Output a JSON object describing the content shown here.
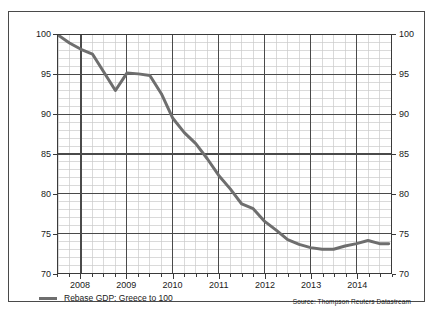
{
  "chart_data": {
    "type": "line",
    "title": "",
    "subtitle": "",
    "xlabel": "",
    "ylabel": "",
    "xlim": [
      2007.5,
      2014.75
    ],
    "ylim": [
      70,
      100
    ],
    "y_ticks": [
      70,
      75,
      80,
      85,
      90,
      95,
      100
    ],
    "y_tick_labels": [
      "70",
      "75",
      "80",
      "85",
      "90",
      "95",
      "100"
    ],
    "y_minor_step": 1,
    "x_ticks": [
      2008,
      2009,
      2010,
      2011,
      2012,
      2013,
      2014
    ],
    "x_tick_labels": [
      "2008",
      "2009",
      "2010",
      "2011",
      "2012",
      "2013",
      "2014"
    ],
    "x_minor_step": 0.25,
    "grid": true,
    "dual_y_axis": true,
    "legend_position": "bottom-left",
    "series": [
      {
        "name": "Rebase GDP: Greece to 100",
        "color": "#6e6e6e",
        "x": [
          2007.5,
          2007.75,
          2008.0,
          2008.25,
          2008.5,
          2008.75,
          2009.0,
          2009.25,
          2009.5,
          2009.75,
          2010.0,
          2010.25,
          2010.5,
          2010.75,
          2011.0,
          2011.25,
          2011.5,
          2011.75,
          2012.0,
          2012.25,
          2012.5,
          2012.75,
          2013.0,
          2013.25,
          2013.5,
          2013.75,
          2014.0,
          2014.25,
          2014.5,
          2014.7
        ],
        "values": [
          100.0,
          99.0,
          98.2,
          97.6,
          95.3,
          93.0,
          95.2,
          95.1,
          94.9,
          92.6,
          89.5,
          87.7,
          86.3,
          84.4,
          82.3,
          80.6,
          78.7,
          78.1,
          76.5,
          75.4,
          74.2,
          73.6,
          73.2,
          73.0,
          73.0,
          73.4,
          73.7,
          74.1,
          73.7,
          73.7
        ]
      }
    ],
    "annotations": {
      "source": "Source: Thompson Reuters Datastream"
    }
  },
  "legend": {
    "items": [
      {
        "label": "Rebase GDP: Greece to 100",
        "color": "#6e6e6e"
      }
    ]
  },
  "colors": {
    "line": "#6e6e6e",
    "grid_major": "#4a4a4a",
    "grid_minor": "#c9c9c9",
    "axis": "#3a3a3a",
    "frame": "#4a4a4a",
    "text": "#1a1a1a"
  }
}
